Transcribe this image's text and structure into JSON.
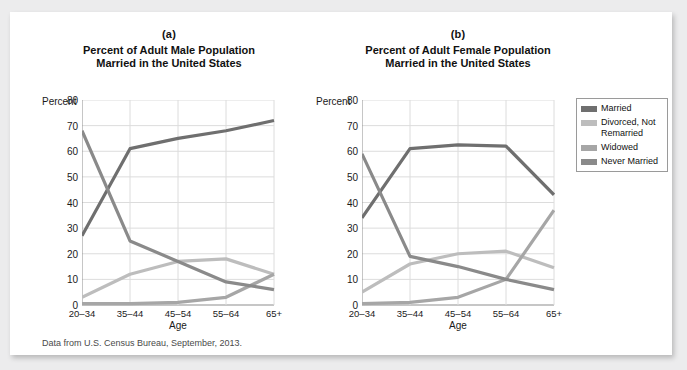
{
  "caption": "Data from U.S. Census Bureau, September, 2013.",
  "axis": {
    "ylabel": "Percent",
    "xlabel": "Age",
    "yticks": [
      "0",
      "10",
      "20",
      "30",
      "40",
      "50",
      "60",
      "70",
      "80"
    ],
    "xticks": [
      "20–34",
      "35–44",
      "45–54",
      "55–64",
      "65+"
    ]
  },
  "legend": {
    "position": "right",
    "items": [
      {
        "label": "Married",
        "color": "#6f6f6f"
      },
      {
        "label": "Divorced, Not Remarried",
        "color": "#bdbdbd"
      },
      {
        "label": "Widowed",
        "color": "#a6a6a6"
      },
      {
        "label": "Never Married",
        "color": "#8a8a8a"
      }
    ]
  },
  "panels": [
    {
      "letter": "(a)",
      "title_line1": "Percent of Adult Male Population",
      "title_line2": "Married in the United States"
    },
    {
      "letter": "(b)",
      "title_line1": "Percent of Adult Female Population",
      "title_line2": "Married in the United States"
    }
  ],
  "chart_data": [
    {
      "type": "line",
      "title": "Percent of Adult Male Population Married in the United States",
      "panel": "(a)",
      "xlabel": "Age",
      "ylabel": "Percent",
      "ylim": [
        0,
        80
      ],
      "ytick_step": 10,
      "grid": true,
      "categories": [
        "20–34",
        "35–44",
        "45–54",
        "55–64",
        "65+"
      ],
      "series": [
        {
          "name": "Married",
          "color": "#6f6f6f",
          "values": [
            27,
            61,
            65,
            68,
            72
          ]
        },
        {
          "name": "Divorced, Not Remarried",
          "color": "#bdbdbd",
          "values": [
            3,
            12,
            17,
            18,
            12
          ]
        },
        {
          "name": "Widowed",
          "color": "#a6a6a6",
          "values": [
            0.5,
            0.5,
            1,
            3,
            12
          ]
        },
        {
          "name": "Never Married",
          "color": "#8a8a8a",
          "values": [
            68,
            25,
            17,
            9,
            6
          ]
        }
      ]
    },
    {
      "type": "line",
      "title": "Percent of Adult Female Population Married in the United States",
      "panel": "(b)",
      "xlabel": "Age",
      "ylabel": "Percent",
      "ylim": [
        0,
        80
      ],
      "ytick_step": 10,
      "grid": true,
      "categories": [
        "20–34",
        "35–44",
        "45–54",
        "55–64",
        "65+"
      ],
      "series": [
        {
          "name": "Married",
          "color": "#6f6f6f",
          "values": [
            34,
            61,
            62.5,
            62,
            43
          ]
        },
        {
          "name": "Divorced, Not Remarried",
          "color": "#bdbdbd",
          "values": [
            5,
            16,
            20,
            21,
            14.5
          ]
        },
        {
          "name": "Widowed",
          "color": "#a6a6a6",
          "values": [
            0.5,
            1,
            3,
            10,
            37
          ]
        },
        {
          "name": "Never Married",
          "color": "#8a8a8a",
          "values": [
            59,
            19,
            15,
            10,
            6
          ]
        }
      ]
    }
  ]
}
